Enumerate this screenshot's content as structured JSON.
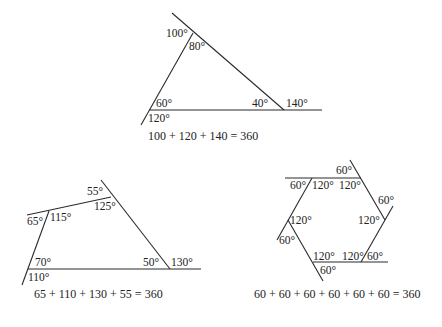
{
  "figures": {
    "triangle": {
      "angles": {
        "top_exterior": "100°",
        "top_interior": "80°",
        "left_interior": "60°",
        "left_exterior": "120°",
        "right_interior": "40°",
        "right_exterior": "140°"
      },
      "equation": "100 + 120 + 140 = 360"
    },
    "quadrilateral": {
      "angles": {
        "top_exterior": "55°",
        "top_interior": "125°",
        "left_exterior": "65°",
        "left_interior": "115°",
        "bottom_left_interior": "70°",
        "bottom_left_exterior": "110°",
        "bottom_right_interior": "50°",
        "bottom_right_exterior": "130°"
      },
      "equation": "65 + 110 + 130 + 55 = 360"
    },
    "hexagon": {
      "angles": {
        "top_right_exterior": "60°",
        "top_left_exterior": "60°",
        "top_left_interior": "120°",
        "top_right_interior": "120°",
        "right_exterior": "60°",
        "right_interior": "120°",
        "left_interior": "120°",
        "left_exterior": "60°",
        "bottom_left_interior": "120°",
        "bottom_right_interior": "120°",
        "bottom_right_exterior": "60°",
        "bottom_left_exterior": "60°"
      },
      "equation": "60 + 60 + 60 + 60 + 60 + 60 = 360"
    }
  }
}
